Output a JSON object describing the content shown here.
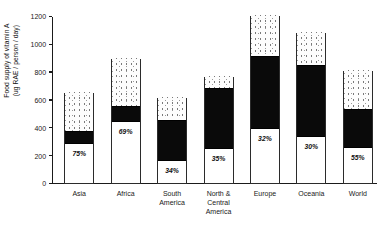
{
  "chart_data": {
    "type": "bar",
    "title": "",
    "subtitle": "",
    "xlabel": "",
    "ylabel": "Food supply of vitamin A\n(ug RAE / person / day)",
    "ylim": [
      0,
      1200
    ],
    "yticks": [
      0,
      200,
      400,
      600,
      800,
      1000,
      1200
    ],
    "ytick_labels": [
      "0",
      "200",
      "400",
      "600",
      "800",
      "1000",
      "1200"
    ],
    "grid": false,
    "legend": null,
    "stacked": true,
    "categories": [
      "Asia",
      "Africa",
      "South\nAmerica",
      "North &\nCentral\nAmerica",
      "Europe",
      "Oceania",
      "World"
    ],
    "series": [
      {
        "name": "plant-source (white, lower segment)",
        "values": [
          280,
          440,
          155,
          245,
          390,
          330,
          250
        ]
      },
      {
        "name": "animal-source (black, middle segment)",
        "values": [
          95,
          115,
          295,
          435,
          525,
          520,
          280
        ]
      },
      {
        "name": "remainder (stippled, upper segment)",
        "values": [
          280,
          345,
          165,
          90,
          295,
          235,
          285
        ]
      }
    ],
    "totals": [
      655,
      900,
      615,
      770,
      1210,
      1085,
      815
    ],
    "segment_black_top": [
      375,
      555,
      450,
      680,
      915,
      850,
      530
    ],
    "segment_white_top": [
      280,
      440,
      155,
      245,
      390,
      330,
      250
    ],
    "annotations": [
      "75%",
      "69%",
      "34%",
      "35%",
      "32%",
      "30%",
      "55%"
    ]
  }
}
